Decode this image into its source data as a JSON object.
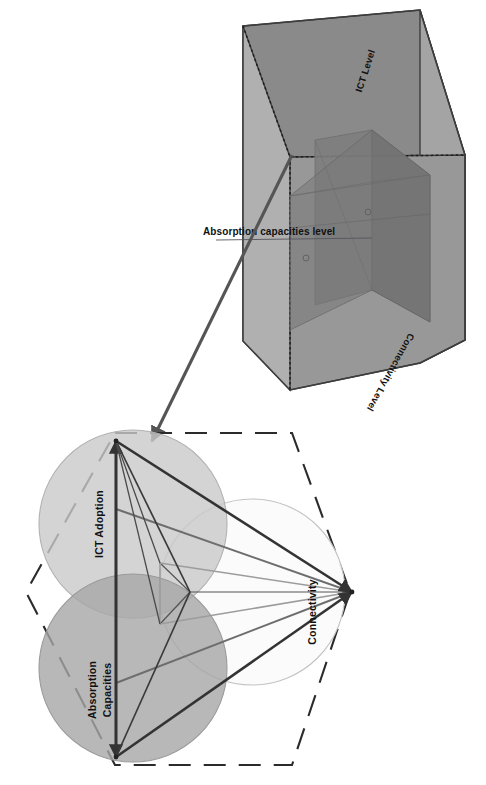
{
  "figure": {
    "cube": {
      "name": "three-dimensional level cube",
      "axis_labels": {
        "ict_level": "ICT Level",
        "connectivity_level": "Connectivity Level",
        "absorption_level": "Absorption capacities level"
      },
      "colors": {
        "outer_face_light": "#a8a8a8",
        "outer_face_mid": "#8f8f8f",
        "outer_face_dark": "#808080",
        "inner_box_dark": "#6f6f6f",
        "inner_box_darker": "#636363",
        "edge": "#3d3d3d"
      }
    },
    "venn": {
      "name": "three-circle venn with inscribed triangles",
      "circles": [
        {
          "id": "ict-adoption",
          "label": "ICT Adoption",
          "color": "#c9c9c9",
          "stroke": "#b0b0b0"
        },
        {
          "id": "absorption-capacities",
          "label": "Absorption Capacities",
          "label_line1": "Absorption",
          "label_line2": "Capacities",
          "color": "#a6a6a6",
          "stroke": "#9a9a9a"
        },
        {
          "id": "connectivity",
          "label": "Connectivity",
          "color": "#fbfbfb",
          "stroke": "#bdbdbd"
        }
      ],
      "boundary": {
        "id": "hexagon-boundary",
        "style": "dashed",
        "color": "#2b2b2b"
      },
      "vertices": [
        {
          "id": "vertex-ict-adoption",
          "label": "ICT Adoption"
        },
        {
          "id": "vertex-absorption-capacities",
          "label": "Absorption Capacities"
        },
        {
          "id": "vertex-connectivity",
          "label": "Connectivity"
        }
      ],
      "colors": {
        "arrow_dark": "#333333",
        "arrow_mid": "#6d6d6d",
        "arrow_light": "#8e8e8e"
      }
    },
    "connector_arrow": {
      "name": "zoom-link-arrow",
      "from": "cube interior point",
      "to": "venn ICT Adoption vertex",
      "color": "#555555"
    }
  }
}
